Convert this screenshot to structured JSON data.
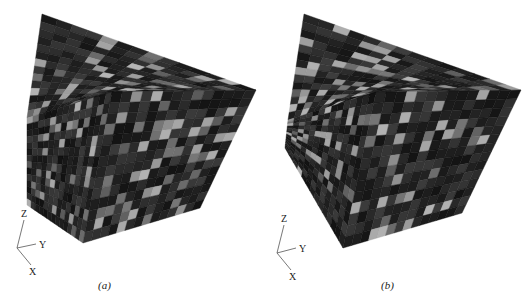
{
  "figure": {
    "panels": [
      {
        "id": "a",
        "caption": "(a)",
        "caption_pos": [
          98,
          285
        ],
        "cube": {
          "top": [
            [
              42,
              14
            ],
            [
              256,
              90
            ],
            [
              120,
              88
            ]
          ],
          "corners": {
            "back_top": [
              42,
              14
            ],
            "right_top": [
              256,
              90
            ],
            "front_top": [
              112,
              92
            ],
            "left": [
              27,
              118
            ],
            "left_bottom": [
              27,
              205
            ],
            "bottom_front": [
              83,
              243
            ],
            "right_bottom": [
              200,
              208
            ]
          },
          "seed": 7
        },
        "axes": {
          "origin": [
            17,
            248
          ],
          "z_end": [
            24,
            220
          ],
          "y_end": [
            36,
            244
          ],
          "x_end": [
            31,
            265
          ],
          "labels": {
            "z": "Z",
            "y": "Y",
            "x": "X"
          }
        }
      },
      {
        "id": "b",
        "caption": "(b)",
        "caption_pos": [
          381,
          285
        ],
        "cube": {
          "corners": {
            "back_top": [
              304,
              14
            ],
            "right_top": [
              521,
              90
            ],
            "front_top": [
              376,
              92
            ],
            "left": [
              288,
              120
            ],
            "left_bottom": [
              285,
              148
            ],
            "bottom_front": [
              343,
              248
            ],
            "right_bottom": [
              462,
              213
            ]
          },
          "seed": 13
        },
        "axes": {
          "origin": [
            277,
            253
          ],
          "z_end": [
            284,
            225
          ],
          "y_end": [
            296,
            248
          ],
          "x_end": [
            291,
            270
          ],
          "labels": {
            "z": "Z",
            "y": "Y",
            "x": "X"
          }
        }
      }
    ],
    "grid_n": 14,
    "colors": {
      "dark": "#1a1a1a",
      "mid": "#3a3a3a",
      "light": "#bdbdbd",
      "lighter": "#d8d8d8"
    }
  }
}
